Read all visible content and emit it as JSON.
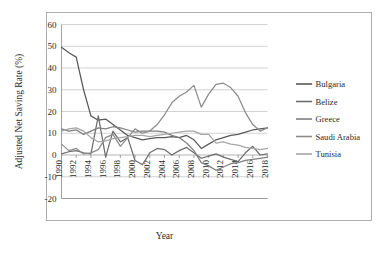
{
  "chart_data": {
    "type": "line",
    "title": "",
    "xlabel": "Year",
    "ylabel": "Adjusted Net Saving Rate (%)",
    "xlim": [
      1990,
      2018
    ],
    "ylim": [
      -20,
      60
    ],
    "yticks": [
      60,
      50,
      40,
      30,
      20,
      10,
      0,
      -10,
      -20
    ],
    "xticks": [
      1990,
      1992,
      1994,
      1996,
      1998,
      2000,
      2002,
      2004,
      2006,
      2008,
      2010,
      2012,
      2014,
      2016,
      2018
    ],
    "grid": "horizontal",
    "legend_position": "right",
    "x": [
      1990,
      1991,
      1992,
      1993,
      1994,
      1995,
      1996,
      1997,
      1998,
      1999,
      2000,
      2001,
      2002,
      2003,
      2004,
      2005,
      2006,
      2007,
      2008,
      2009,
      2010,
      2011,
      2012,
      2013,
      2014,
      2015,
      2016,
      2017,
      2018
    ],
    "series": [
      {
        "name": "Bulgaria",
        "color": "#595959",
        "values": [
          49.5,
          47.0,
          45.0,
          30.0,
          18.0,
          16.0,
          16.5,
          14.0,
          11.5,
          9.0,
          8.0,
          7.0,
          7.5,
          8.0,
          8.0,
          8.5,
          8.0,
          9.0,
          7.0,
          3.0,
          5.0,
          7.0,
          8.0,
          9.0,
          9.5,
          10.5,
          11.5,
          12.0,
          12.5
        ]
      },
      {
        "name": "Belize",
        "color": "#6e6e6e",
        "values": [
          0.5,
          1.5,
          2.0,
          1.0,
          0.5,
          18.0,
          -1.0,
          11.0,
          6.0,
          8.0,
          -2.5,
          -4.5,
          1.0,
          3.0,
          2.5,
          0.0,
          2.0,
          3.5,
          1.0,
          -1.5,
          -0.5,
          0.5,
          -1.0,
          -2.0,
          -3.0,
          1.0,
          4.0,
          0.0,
          0.5
        ]
      },
      {
        "name": "Greece",
        "color": "#7f7f7f",
        "values": [
          12.0,
          11.0,
          11.5,
          9.5,
          11.0,
          12.5,
          12.0,
          13.0,
          12.5,
          11.5,
          10.5,
          11.0,
          11.0,
          11.0,
          10.5,
          9.0,
          8.0,
          5.5,
          2.0,
          -3.5,
          -5.0,
          -7.0,
          -5.5,
          -4.0,
          -3.5,
          -2.5,
          -2.0,
          -1.5,
          -1.0
        ]
      },
      {
        "name": "Saudi Arabia",
        "color": "#8c8c8c",
        "values": [
          5.0,
          2.0,
          3.0,
          0.5,
          1.0,
          2.5,
          8.0,
          9.5,
          4.0,
          8.0,
          12.0,
          10.0,
          11.0,
          14.0,
          18.5,
          24.0,
          27.0,
          29.0,
          32.0,
          22.0,
          28.0,
          32.5,
          33.0,
          31.0,
          27.0,
          19.5,
          14.0,
          11.0,
          12.5
        ]
      },
      {
        "name": "Tunisia",
        "color": "#a6a6a6",
        "values": [
          11.0,
          12.0,
          12.5,
          11.0,
          8.0,
          6.0,
          6.5,
          7.5,
          8.0,
          8.5,
          9.0,
          9.0,
          8.5,
          9.0,
          9.5,
          10.0,
          10.5,
          11.0,
          11.0,
          9.5,
          9.5,
          5.5,
          6.0,
          5.0,
          4.5,
          3.5,
          3.0,
          2.5,
          3.0
        ]
      }
    ]
  },
  "legend": {
    "items": [
      {
        "label": "Bulgaria"
      },
      {
        "label": "Belize"
      },
      {
        "label": "Greece"
      },
      {
        "label": "Saudi Arabia"
      },
      {
        "label": "Tunisia"
      }
    ]
  }
}
